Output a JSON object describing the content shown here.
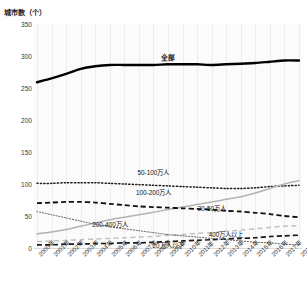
{
  "chart_data": {
    "type": "line",
    "title": "",
    "ylabel": "城市数（个）",
    "xlabel": "",
    "ylim": [
      0,
      350
    ],
    "yticks": [
      0,
      50,
      100,
      150,
      200,
      250,
      300,
      350
    ],
    "grid": "vertical",
    "legend": "inline-annotations",
    "categories": [
      "2000年",
      "2001年",
      "2002年",
      "2003年",
      "2004年",
      "2005年",
      "2006年",
      "2007年",
      "2008年",
      "2009年",
      "2010年",
      "2011年",
      "2012年",
      "2013年",
      "2014年",
      "2015年",
      "2016年",
      "2017年",
      "2018年"
    ],
    "series": [
      {
        "name": "全部",
        "style": "solid-thick-black",
        "color": "#000000",
        "values": [
          259,
          265,
          272,
          280,
          284,
          286,
          286,
          286,
          286,
          287,
          287,
          287,
          286,
          287,
          288,
          289,
          291,
          293,
          293
        ]
      },
      {
        "name": "50-100万人",
        "style": "dotted-black",
        "color": "#1a1a1a",
        "values": [
          101,
          101,
          102,
          102,
          102,
          101,
          100,
          99,
          98,
          97,
          96,
          95,
          94,
          93,
          93,
          94,
          96,
          97,
          98
        ]
      },
      {
        "name": "100-200万人",
        "style": "solid-gray",
        "color": "#b3b3b3",
        "values": [
          22,
          25,
          29,
          34,
          39,
          44,
          48,
          52,
          56,
          60,
          64,
          68,
          72,
          76,
          80,
          86,
          93,
          100,
          105
        ]
      },
      {
        "name": "20-50万人",
        "style": "dashed-black-heavy",
        "color": "#111111",
        "values": [
          70,
          71,
          72,
          72,
          71,
          69,
          67,
          65,
          64,
          63,
          62,
          61,
          60,
          58,
          57,
          55,
          53,
          50,
          48
        ]
      },
      {
        "name": "200-400万人",
        "style": "dashed-lightgray",
        "color": "#c2c2c2",
        "values": [
          10,
          11,
          12,
          13,
          14,
          15,
          16,
          17,
          18,
          20,
          21,
          23,
          24,
          26,
          28,
          30,
          32,
          34,
          35
        ]
      },
      {
        "name": "400万人以上",
        "style": "dashed-black",
        "color": "#1a1a1a",
        "values": [
          5,
          5,
          6,
          6,
          7,
          7,
          8,
          8,
          9,
          10,
          11,
          12,
          13,
          14,
          15,
          16,
          18,
          19,
          20
        ]
      },
      {
        "name": "20万人以下",
        "style": "fine-dotted",
        "color": "#4d4d4d",
        "values": [
          57,
          52,
          47,
          42,
          37,
          33,
          30,
          27,
          24,
          21,
          19,
          17,
          15,
          13,
          11,
          9,
          8,
          6,
          5
        ]
      }
    ],
    "annotations": [
      {
        "text": "全部",
        "x_index": 9,
        "value": 300
      },
      {
        "text": "50-100万人",
        "x_index": 8,
        "value": 118
      },
      {
        "text": "100-200万人",
        "x_index": 8,
        "value": 88
      },
      {
        "text": "20-50万人",
        "x_index": 12,
        "value": 62
      },
      {
        "text": "200-400万人",
        "x_index": 5,
        "value": 38
      },
      {
        "text": "400万人以上",
        "x_index": 13,
        "value": 22
      },
      {
        "text": "20万人以下",
        "x_index": 9,
        "value": 5
      }
    ]
  }
}
